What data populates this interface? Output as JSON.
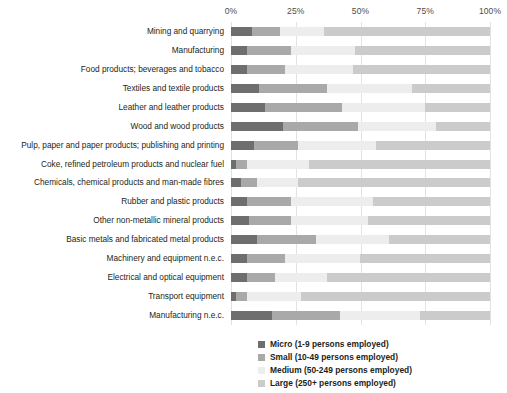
{
  "chart_data": {
    "type": "bar",
    "orientation": "horizontal",
    "stacked": true,
    "normalized_percent": true,
    "title": "",
    "subtitle": "",
    "xlabel": "",
    "ylabel": "",
    "xlim": [
      0,
      100
    ],
    "xticks": [
      "0%",
      "25%",
      "50%",
      "75%",
      "100%"
    ],
    "xtick_values": [
      0,
      25,
      50,
      75,
      100
    ],
    "grid": true,
    "grid_axis": "x",
    "legend_position": "bottom-right",
    "categories": [
      "Mining and quarrying",
      "Manufacturing",
      "Food products; beverages and tobacco",
      "Textiles and textile products",
      "Leather and leather products",
      "Wood and wood products",
      "Pulp, paper and paper products; publishing and printing",
      "Coke, refined petroleum products and nuclear fuel",
      "Chemicals, chemical products and man-made fibres",
      "Rubber and plastic products",
      "Other non-metallic mineral products",
      "Basic metals and fabricated metal products",
      "Machinery and equipment n.e.c.",
      "Electrical and optical equipment",
      "Transport equipment",
      "Manufacturing n.e.c."
    ],
    "series": [
      {
        "name": "Micro (1-9 persons employed)",
        "color": "#6e6e6e",
        "values": [
          8,
          6,
          6,
          11,
          13,
          20,
          9,
          2,
          4,
          6,
          7,
          10,
          6,
          6,
          2,
          16
        ]
      },
      {
        "name": "Small (10-49 persons employed)",
        "color": "#a9a9a9",
        "values": [
          11,
          17,
          15,
          26,
          30,
          29,
          17,
          4,
          6,
          17,
          16,
          23,
          15,
          11,
          4,
          26
        ]
      },
      {
        "name": "Medium (50-249 persons employed)",
        "color": "#ededed",
        "values": [
          17,
          25,
          26,
          33,
          32,
          30,
          30,
          24,
          16,
          32,
          30,
          28,
          29,
          20,
          21,
          31
        ]
      },
      {
        "name": "Large (250+ persons employed)",
        "color": "#cbcbcb",
        "values": [
          64,
          52,
          53,
          30,
          25,
          21,
          44,
          70,
          74,
          45,
          47,
          39,
          50,
          63,
          73,
          27
        ]
      }
    ]
  },
  "legend": {
    "items": [
      {
        "label": "Micro (1-9 persons employed)",
        "key": "micro"
      },
      {
        "label": "Small (10-49 persons employed)",
        "key": "small"
      },
      {
        "label": "Medium (50-249 persons employed)",
        "key": "medium"
      },
      {
        "label": "Large (250+ persons employed)",
        "key": "large"
      }
    ]
  },
  "colors": {
    "micro": "#6e6e6e",
    "small": "#a9a9a9",
    "medium": "#ededed",
    "large": "#cbcbcb",
    "gridline": "#e3e3e3",
    "text": "#231f20",
    "tick_text": "#4d4d4d"
  }
}
